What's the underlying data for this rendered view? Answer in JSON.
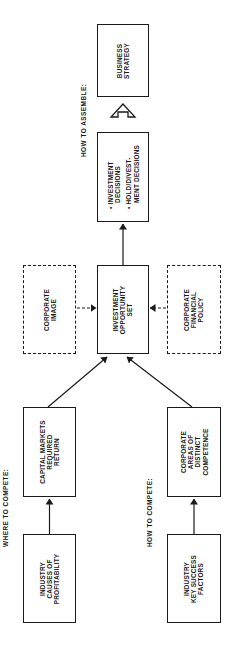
{
  "diagram": {
    "orientation": "rotated 90 degrees counter-clockwise",
    "section_labels": {
      "where_to_compete": "WHERE TO COMPETE:",
      "how_to_compete": "HOW TO COMPETE:",
      "how_to_assemble": "HOW TO ASSEMBLE:"
    },
    "boxes": {
      "business_strategy": {
        "lines": [
          "BUSINESS",
          "STRATEGY"
        ],
        "style": "solid"
      },
      "decisions": {
        "items": [
          {
            "bullet": "•",
            "lines": [
              "INVESTMENT",
              "DECISIONS"
            ]
          },
          {
            "bullet": "•",
            "lines": [
              "HOLD/DIVEST-",
              "MENT DECISIONS"
            ]
          }
        ],
        "style": "solid"
      },
      "investment_opportunity_set": {
        "lines": [
          "INVESTMENT",
          "OPPORTUNITY",
          "SET"
        ],
        "style": "solid"
      },
      "corporate_image": {
        "lines": [
          "CORPORATE",
          "IMAGE"
        ],
        "style": "dashed"
      },
      "corporate_financial_policy": {
        "lines": [
          "CORPORATE",
          "FINANCIAL",
          "POLICY"
        ],
        "style": "dashed"
      },
      "capital_markets": {
        "lines": [
          "CAPITAL MARKETS",
          "REQUIRED",
          "RETURN"
        ],
        "style": "solid"
      },
      "industry_causes": {
        "lines": [
          "INDUSTRY",
          "CAUSES OF",
          "PROFITABILITY"
        ],
        "style": "solid"
      },
      "corporate_areas": {
        "lines": [
          "CORPORATE",
          "AREAS OF",
          "DISTINCT",
          "COMPETENCE"
        ],
        "style": "solid"
      },
      "industry_ksf": {
        "lines": [
          "INDUSTRY",
          "KEY SUCCESS",
          "FACTORS"
        ],
        "style": "solid"
      }
    },
    "connections": [
      {
        "from": "industry_causes",
        "to": "capital_markets",
        "style": "solid"
      },
      {
        "from": "industry_ksf",
        "to": "corporate_areas",
        "style": "solid"
      },
      {
        "from": "capital_markets",
        "to": "investment_opportunity_set",
        "style": "solid"
      },
      {
        "from": "corporate_areas",
        "to": "investment_opportunity_set",
        "style": "solid"
      },
      {
        "from": "corporate_image",
        "to": "investment_opportunity_set",
        "style": "dashed"
      },
      {
        "from": "corporate_financial_policy",
        "to": "investment_opportunity_set",
        "style": "dashed"
      },
      {
        "from": "investment_opportunity_set",
        "to": "decisions",
        "style": "solid"
      },
      {
        "from": "decisions",
        "to": "business_strategy",
        "style": "hollow-block-arrow"
      }
    ]
  }
}
